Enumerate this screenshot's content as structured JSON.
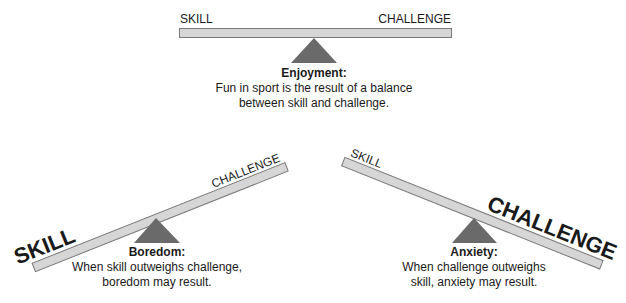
{
  "colors": {
    "bar_fill": "#d6d6d6",
    "bar_stroke": "#7a7a7a",
    "fulcrum": "#6a6a6a",
    "text": "#1a1a1a"
  },
  "balanced": {
    "left_label": "SKILL",
    "right_label": "CHALLENGE",
    "title": "Enjoyment:",
    "lines": [
      "Fun in sport is the result of a balance",
      "between skill and challenge."
    ]
  },
  "boredom": {
    "left_label": "SKILL",
    "right_label": "CHALLENGE",
    "title": "Boredom:",
    "lines": [
      "When skill outweighs challenge,",
      "boredom may result."
    ]
  },
  "anxiety": {
    "left_label": "SKILL",
    "right_label": "CHALLENGE",
    "title": "Anxiety:",
    "lines": [
      "When challenge outweighs",
      "skill, anxiety may result."
    ]
  }
}
